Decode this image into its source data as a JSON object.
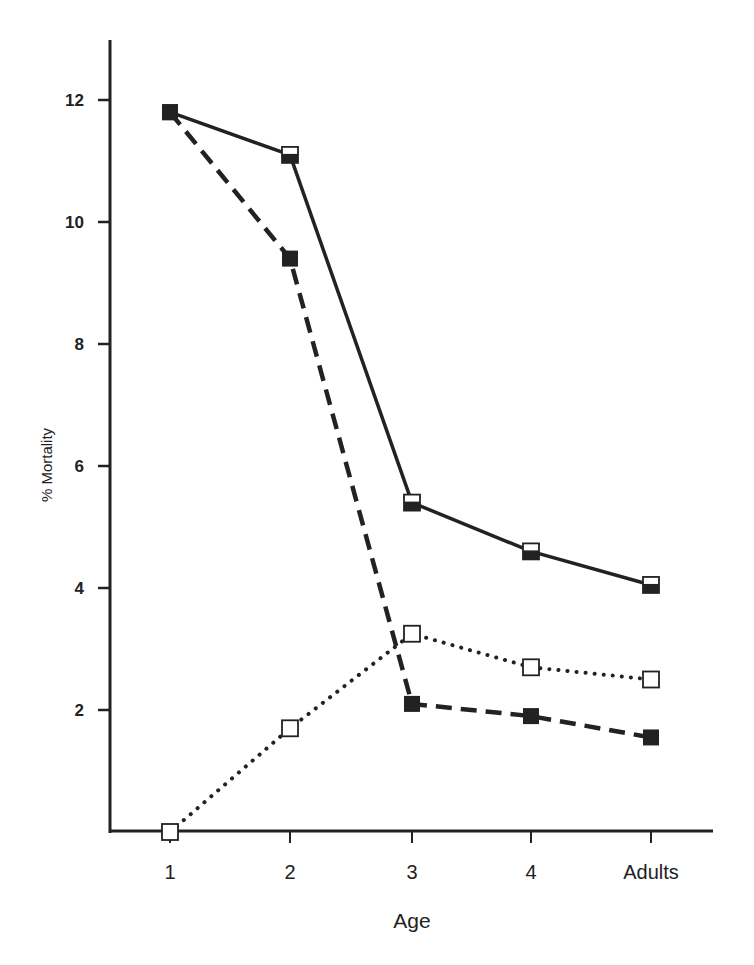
{
  "chart_data": {
    "type": "line",
    "title": "",
    "xlabel": "Age",
    "ylabel": "% Mortality",
    "categories": [
      "1",
      "2",
      "3",
      "4",
      "Adults"
    ],
    "yticks": [
      2,
      4,
      6,
      8,
      10,
      12
    ],
    "ylim": [
      0,
      13
    ],
    "grid": false,
    "legend": "none",
    "series": [
      {
        "name": "total (solid line)",
        "line_style": "solid",
        "marker": "half-filled-square",
        "values": [
          11.8,
          11.1,
          5.4,
          4.6,
          4.05
        ]
      },
      {
        "name": "filled squares (dashed line)",
        "line_style": "dashed",
        "marker": "filled-square",
        "values": [
          11.8,
          9.4,
          2.1,
          1.9,
          1.55
        ]
      },
      {
        "name": "open squares (dotted line)",
        "line_style": "dotted",
        "marker": "open-square",
        "values": [
          0,
          1.7,
          3.25,
          2.7,
          2.5
        ]
      }
    ]
  },
  "colors": {
    "ink": "#222222",
    "background": "#ffffff"
  }
}
